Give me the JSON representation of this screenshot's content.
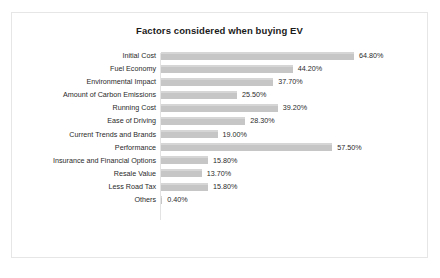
{
  "chart_data": {
    "type": "bar",
    "orientation": "horizontal",
    "title": "Factors considered when buying EV",
    "xlabel": "",
    "ylabel": "",
    "grid": false,
    "legend": false,
    "axis_range": [
      0,
      70
    ],
    "categories": [
      "Initial Cost",
      "Fuel Economy",
      "Environmental Impact",
      "Amount of Carbon Emissions",
      "Running Cost",
      "Ease of Driving",
      "Current Trends and Brands",
      "Performance",
      "Insurance and Financial Options",
      "Resale Value",
      "Less Road Tax",
      "Others"
    ],
    "values": [
      64.8,
      44.2,
      37.7,
      25.5,
      39.2,
      28.3,
      19.0,
      57.5,
      15.8,
      13.7,
      15.8,
      0.4
    ],
    "value_labels": [
      "64.80%",
      "44.20%",
      "37.70%",
      "25.50%",
      "39.20%",
      "28.30%",
      "19.00%",
      "57.50%",
      "15.80%",
      "13.70%",
      "15.80%",
      "0.40%"
    ],
    "bar_color": "#c6c6c6",
    "text_color": "#2a2a2a",
    "border_color": "#e6e6e6"
  }
}
